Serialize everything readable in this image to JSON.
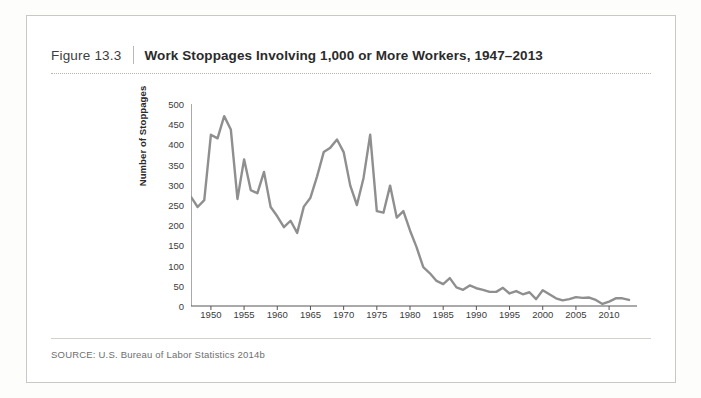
{
  "figure": {
    "number": "Figure 13.3",
    "title": "Work Stoppages Involving 1,000 or More Workers, 1947–2013",
    "source_label": "SOURCE:",
    "source_text": "U.S. Bureau of Labor Statistics 2014b"
  },
  "chart_data": {
    "type": "line",
    "title": "Work Stoppages Involving 1,000 or More Workers, 1947–2013",
    "xlabel": "",
    "ylabel": "Number of Stoppages",
    "xlim": [
      1947,
      2013
    ],
    "ylim": [
      0,
      500
    ],
    "yticks": [
      0,
      50,
      100,
      150,
      200,
      250,
      300,
      350,
      400,
      450,
      500
    ],
    "xticks": [
      1950,
      1955,
      1960,
      1965,
      1970,
      1975,
      1980,
      1985,
      1990,
      1995,
      2000,
      2005,
      2010
    ],
    "grid": false,
    "legend": "none",
    "line_color": "#8f8f8f",
    "x": [
      1947,
      1948,
      1949,
      1950,
      1951,
      1952,
      1953,
      1954,
      1955,
      1956,
      1957,
      1958,
      1959,
      1960,
      1961,
      1962,
      1963,
      1964,
      1965,
      1966,
      1967,
      1968,
      1969,
      1970,
      1971,
      1972,
      1973,
      1974,
      1975,
      1976,
      1977,
      1978,
      1979,
      1980,
      1981,
      1982,
      1983,
      1984,
      1985,
      1986,
      1987,
      1988,
      1989,
      1990,
      1991,
      1992,
      1993,
      1994,
      1995,
      1996,
      1997,
      1998,
      1999,
      2000,
      2001,
      2002,
      2003,
      2004,
      2005,
      2006,
      2007,
      2008,
      2009,
      2010,
      2011,
      2012,
      2013
    ],
    "values": [
      270,
      245,
      262,
      424,
      415,
      470,
      437,
      265,
      363,
      287,
      279,
      332,
      245,
      222,
      195,
      211,
      181,
      246,
      268,
      321,
      381,
      392,
      412,
      381,
      298,
      250,
      317,
      424,
      235,
      231,
      298,
      219,
      235,
      187,
      145,
      96,
      81,
      62,
      54,
      69,
      46,
      40,
      51,
      44,
      40,
      35,
      35,
      45,
      31,
      37,
      29,
      34,
      17,
      39,
      29,
      19,
      14,
      17,
      22,
      20,
      21,
      15,
      5,
      11,
      19,
      19,
      15
    ]
  }
}
